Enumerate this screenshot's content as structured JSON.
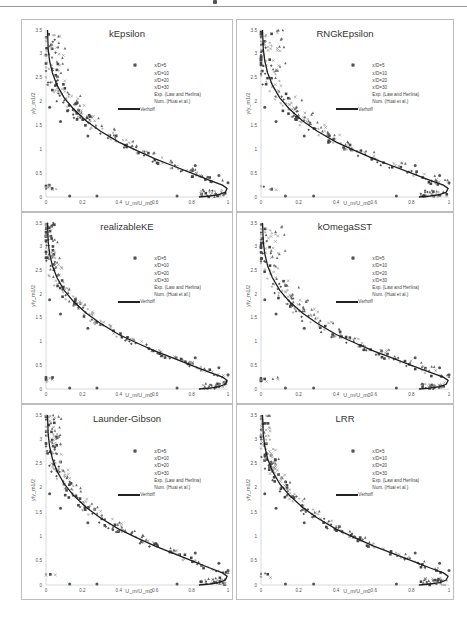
{
  "page": {
    "header_mark": "•"
  },
  "chart_data": [
    {
      "type": "scatter",
      "title": "kEpsilon",
      "xlabel": "U_m/U_m0",
      "ylabel": "y/y_m1/2",
      "xlim": [
        0,
        1
      ],
      "ylim": [
        0,
        3.5
      ],
      "xticks": [
        "0",
        "0.2",
        "0.4",
        "0.6",
        "0.8",
        "1"
      ],
      "yticks": [
        "0",
        "0.5",
        "1",
        "1.5",
        "2",
        "2.5",
        "3",
        "3.5"
      ],
      "grid": false,
      "legend_position": "upper right inside",
      "spread": 0.05,
      "shift": 0.03
    },
    {
      "type": "scatter",
      "title": "RNGkEpsilon",
      "xlabel": "U_m/U_m0",
      "ylabel": "y/y_m1/2",
      "xlim": [
        0,
        1
      ],
      "ylim": [
        0,
        3.5
      ],
      "xticks": [
        "0",
        "0.2",
        "0.4",
        "0.6",
        "0.8",
        "1"
      ],
      "yticks": [
        "0",
        "0.5",
        "1",
        "1.5",
        "2",
        "2.5",
        "3",
        "3.5"
      ],
      "grid": false,
      "legend_position": "upper right inside",
      "spread": 0.05,
      "shift": 0.04
    },
    {
      "type": "scatter",
      "title": "realizableKE",
      "xlabel": "U_m/U_m0",
      "ylabel": "y/y_m1/2",
      "xlim": [
        0,
        1
      ],
      "ylim": [
        0,
        3.5
      ],
      "xticks": [
        "0",
        "0.2",
        "0.4",
        "0.6",
        "0.8",
        "1"
      ],
      "yticks": [
        "0",
        "0.5",
        "1",
        "1.5",
        "2",
        "2.5",
        "3",
        "3.5"
      ],
      "grid": false,
      "legend_position": "upper right inside",
      "spread": 0.04,
      "shift": 0.01
    },
    {
      "type": "scatter",
      "title": "kOmegaSST",
      "xlabel": "U_m/U_m0",
      "ylabel": "y/y_m1/2",
      "xlim": [
        0,
        1
      ],
      "ylim": [
        0,
        3.5
      ],
      "xticks": [
        "0",
        "0.2",
        "0.4",
        "0.6",
        "0.8",
        "1"
      ],
      "yticks": [
        "0",
        "0.5",
        "1",
        "1.5",
        "2",
        "2.5",
        "3",
        "3.5"
      ],
      "grid": false,
      "legend_position": "upper right inside",
      "spread": 0.05,
      "shift": 0.04
    },
    {
      "type": "scatter",
      "title": "Launder-Gibson",
      "xlabel": "U_m/U_m0",
      "ylabel": "y/y_m1/2",
      "xlim": [
        0,
        1
      ],
      "ylim": [
        0,
        3.5
      ],
      "xticks": [
        "0",
        "0.2",
        "0.4",
        "0.6",
        "0.8",
        "1"
      ],
      "yticks": [
        "0",
        "0.5",
        "1",
        "1.5",
        "2",
        "2.5",
        "3",
        "3.5"
      ],
      "grid": false,
      "legend_position": "upper right inside",
      "spread": 0.045,
      "shift": 0.02
    },
    {
      "type": "scatter",
      "title": "LRR",
      "xlabel": "U_m/U_m0",
      "ylabel": "y/y_m1/2",
      "xlim": [
        0,
        1
      ],
      "ylim": [
        0,
        3.5
      ],
      "xticks": [
        "0",
        "0.2",
        "0.4",
        "0.6",
        "0.8",
        "1"
      ],
      "yticks": [
        "0",
        "0.5",
        "1",
        "1.5",
        "2",
        "2.5",
        "3",
        "3.5"
      ],
      "grid": false,
      "legend_position": "upper right inside",
      "spread": 0.04,
      "shift": 0.015
    }
  ],
  "legend": [
    {
      "label": "x/D=5",
      "marker": "diamond",
      "color": "#555555"
    },
    {
      "label": "x/D=10",
      "marker": "square",
      "color": "#444444"
    },
    {
      "label": "x/D=20",
      "marker": "triangle",
      "color": "#6a6a6a"
    },
    {
      "label": "x/D=30",
      "marker": "x",
      "color": "#8a8a8a"
    },
    {
      "label": "Exp. (Law and Herlina)",
      "marker": "star",
      "color": "#9a9a9a"
    },
    {
      "label": "Num. (Huai et al.)",
      "marker": "circle",
      "color": "#555555"
    },
    {
      "label": "Verhoff",
      "marker": "line",
      "color": "#222222"
    }
  ],
  "verhoff_curve": {
    "description": "y/y_m1/2 vs U_m/U_m0",
    "points": [
      [
        0.84,
        0.0
      ],
      [
        0.9,
        0.02
      ],
      [
        0.95,
        0.05
      ],
      [
        0.985,
        0.1
      ],
      [
        0.995,
        0.18
      ],
      [
        0.97,
        0.25
      ],
      [
        0.9,
        0.35
      ],
      [
        0.8,
        0.5
      ],
      [
        0.7,
        0.65
      ],
      [
        0.6,
        0.8
      ],
      [
        0.5,
        0.97
      ],
      [
        0.4,
        1.15
      ],
      [
        0.3,
        1.38
      ],
      [
        0.22,
        1.6
      ],
      [
        0.15,
        1.85
      ],
      [
        0.1,
        2.08
      ],
      [
        0.06,
        2.35
      ],
      [
        0.035,
        2.6
      ],
      [
        0.02,
        2.85
      ],
      [
        0.012,
        3.1
      ],
      [
        0.008,
        3.5
      ]
    ]
  },
  "num_huai_points": [
    [
      0.02,
      1.88
    ],
    [
      0.08,
      1.58
    ],
    [
      0.13,
      0.02
    ],
    [
      0.23,
      1.28
    ],
    [
      0.28,
      0.02
    ],
    [
      0.72,
      0.02
    ],
    [
      0.82,
      0.66
    ],
    [
      0.95,
      0.45
    ],
    [
      1.0,
      0.3
    ]
  ]
}
